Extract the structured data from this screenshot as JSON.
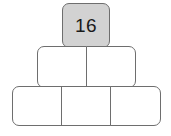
{
  "figure": {
    "kind": "number-pyramid",
    "title": "",
    "background_color": "#ffffff",
    "stroke_color": "#6e6e6e",
    "filled_cell_color": "#d2d2d2",
    "empty_cell_color": "#ffffff",
    "value_text_color": "#1a1a1a"
  },
  "rows": [
    {
      "name": "top-row",
      "cells": [
        {
          "name": "cell-top-1",
          "value": "16",
          "filled": true
        }
      ]
    },
    {
      "name": "middle-row",
      "cells": [
        {
          "name": "cell-middle-1",
          "value": "",
          "filled": false
        },
        {
          "name": "cell-middle-2",
          "value": "",
          "filled": false
        }
      ]
    },
    {
      "name": "bottom-row",
      "cells": [
        {
          "name": "cell-bottom-1",
          "value": "",
          "filled": false
        },
        {
          "name": "cell-bottom-2",
          "value": "",
          "filled": false
        },
        {
          "name": "cell-bottom-3",
          "value": "",
          "filled": false
        }
      ]
    }
  ]
}
